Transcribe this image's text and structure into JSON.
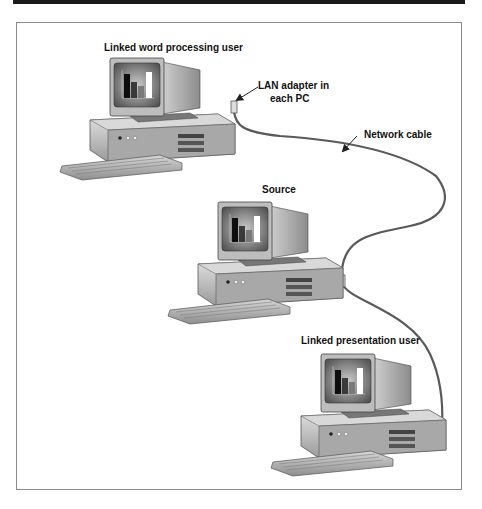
{
  "diagram": {
    "title_bar_color": "#1a1a1a",
    "labels": {
      "word_user": "Linked word processing user",
      "lan_adapter_line1": "LAN adapter in",
      "lan_adapter_line2": "each PC",
      "network_cable": "Network cable",
      "source": "Source",
      "presentation_user": "Linked presentation user"
    },
    "nodes": [
      {
        "id": "word-processing-pc",
        "label": "Linked word processing user",
        "icon": "desktop-computer-icon"
      },
      {
        "id": "source-pc",
        "label": "Source",
        "icon": "desktop-computer-icon"
      },
      {
        "id": "presentation-pc",
        "label": "Linked presentation user",
        "icon": "desktop-computer-icon"
      }
    ],
    "edges": [
      {
        "from": "word-processing-pc",
        "to": "source-pc",
        "label": "Network cable"
      },
      {
        "from": "source-pc",
        "to": "presentation-pc",
        "label": "Network cable"
      }
    ],
    "screen_chart": {
      "type": "bar",
      "bars": [
        "dark",
        "medium",
        "light",
        "white"
      ]
    }
  }
}
